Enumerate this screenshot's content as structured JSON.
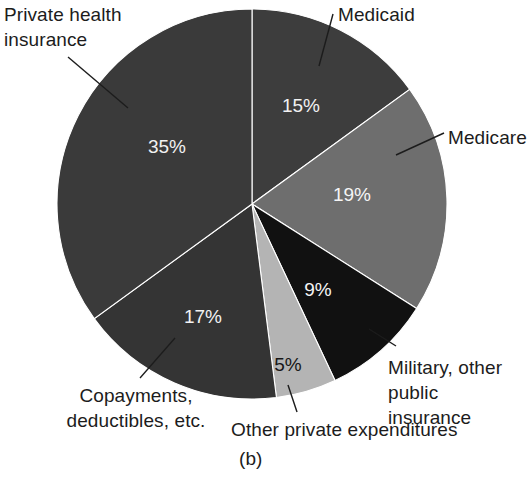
{
  "figure": {
    "caption": "(b)",
    "background": "#ffffff"
  },
  "chart_data": {
    "type": "pie",
    "title": "",
    "subtitle": "",
    "xlabel": "",
    "ylabel": "",
    "grid": false,
    "legend_position": "none",
    "units": "percent",
    "start_angle_deg": 0,
    "direction": "clockwise",
    "center": {
      "x": 252,
      "y": 204,
      "radius": 195
    },
    "labels": [
      "Private health insurance",
      "Medicaid",
      "Medicare",
      "Military, other public insurance",
      "Other private expenditures",
      "Copayments, deductibles, etc."
    ],
    "values": [
      35,
      15,
      19,
      9,
      5,
      17
    ],
    "colors": [
      "#3a3a3a",
      "#3d3d3d",
      "#6e6e6e",
      "#111111",
      "#b4b4b4",
      "#343434"
    ],
    "slices": [
      {
        "name": "medicaid",
        "label": "Medicaid",
        "label_lines": [
          "Medicaid"
        ],
        "value": 15,
        "percent_text": "15%",
        "color": "#3d3d3d",
        "percent_text_color": "#f2f2f2",
        "percent_x": 301,
        "percent_y": 107,
        "start_deg": 0,
        "end_deg": 54,
        "leader": {
          "x1": 333,
          "y1": 14,
          "x2": 319,
          "y2": 66
        }
      },
      {
        "name": "medicare",
        "label": "Medicare",
        "label_lines": [
          "Medicare"
        ],
        "value": 19,
        "percent_text": "19%",
        "color": "#6e6e6e",
        "percent_text_color": "#f5f5f5",
        "percent_x": 352,
        "percent_y": 196,
        "start_deg": 54,
        "end_deg": 122.4,
        "leader": {
          "x1": 444,
          "y1": 133,
          "x2": 396,
          "y2": 155
        }
      },
      {
        "name": "military-other-public-insurance",
        "label": "Military, other public insurance",
        "label_lines": [
          "Military, other",
          "public insurance"
        ],
        "value": 9,
        "percent_text": "9%",
        "color": "#111111",
        "percent_text_color": "#f5f5f5",
        "percent_x": 318,
        "percent_y": 291,
        "start_deg": 122.4,
        "end_deg": 154.8,
        "leader": {
          "x1": 396,
          "y1": 346,
          "x2": 369,
          "y2": 329
        }
      },
      {
        "name": "other-private-expenditures",
        "label": "Other private expenditures",
        "label_lines": [
          "Other private expenditures"
        ],
        "value": 5,
        "percent_text": "5%",
        "color": "#b4b4b4",
        "percent_text_color": "#171717",
        "percent_x": 288,
        "percent_y": 366,
        "start_deg": 154.8,
        "end_deg": 172.8,
        "leader": {
          "x1": 297,
          "y1": 412,
          "x2": 288,
          "y2": 385
        }
      },
      {
        "name": "copayments-deductibles-etc",
        "label": "Copayments, deductibles, etc.",
        "label_lines": [
          "Copayments,",
          "deductibles, etc."
        ],
        "value": 17,
        "percent_text": "17%",
        "color": "#343434",
        "percent_text_color": "#f2f2f2",
        "percent_x": 203,
        "percent_y": 318,
        "start_deg": 172.8,
        "end_deg": 234,
        "leader": {
          "x1": 140,
          "y1": 378,
          "x2": 175,
          "y2": 338
        }
      },
      {
        "name": "private-health-insurance",
        "label": "Private health insurance",
        "label_lines": [
          "Private health",
          "insurance"
        ],
        "value": 35,
        "percent_text": "35%",
        "color": "#3a3a3a",
        "percent_text_color": "#f2f2f2",
        "percent_x": 167,
        "percent_y": 148,
        "start_deg": 234,
        "end_deg": 360,
        "leader": {
          "x1": 68,
          "y1": 57,
          "x2": 128,
          "y2": 108
        }
      }
    ]
  }
}
